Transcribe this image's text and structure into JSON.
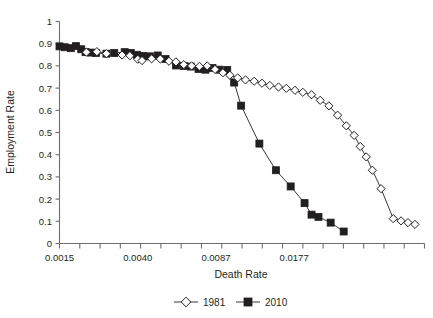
{
  "chart_data": {
    "type": "line",
    "title": "",
    "xlabel": "Death Rate",
    "ylabel": "Employment Rate",
    "ylim": [
      0,
      1
    ],
    "ytick_labels": [
      "1",
      "0.9",
      "0.8",
      "0.7",
      "0.6",
      "0.5",
      "0.4",
      "0.3",
      "0.2",
      "0.1",
      "0"
    ],
    "ytick_values": [
      1,
      0.9,
      0.8,
      0.7,
      0.6,
      0.5,
      0.4,
      0.3,
      0.2,
      0.1,
      0
    ],
    "xtick_labels": [
      "0.0015",
      "0.0040",
      "0.0087",
      "0.0177"
    ],
    "xtick_label_positions": [
      0,
      9,
      18,
      27
    ],
    "x_minor_tick_count": 18,
    "grid": false,
    "legend_position": "bottom",
    "marker_styles": {
      "1981": "open-diamond",
      "2010": "filled-square"
    },
    "series": [
      {
        "name": "1981",
        "marker": "open-diamond",
        "x": [
          3.1,
          4.3,
          5.4,
          7.2,
          8.1,
          9.0,
          9.5,
          10.6,
          11.6,
          12.6,
          13.4,
          14.3,
          15.2,
          16.1,
          17.0,
          17.9,
          18.8,
          19.6,
          20.5,
          21.4,
          22.4,
          23.3,
          24.2,
          25.2,
          26.1,
          27.1,
          28.0,
          29.0,
          30.0,
          31.0,
          32.0,
          33.0,
          33.9,
          34.6,
          35.3,
          36.0
        ],
        "values": [
          0.862,
          0.864,
          0.855,
          0.849,
          0.846,
          0.83,
          0.824,
          0.832,
          0.831,
          0.821,
          0.818,
          0.806,
          0.8,
          0.798,
          0.8,
          0.784,
          0.769,
          0.758,
          0.746,
          0.737,
          0.731,
          0.722,
          0.712,
          0.705,
          0.699,
          0.69,
          0.681,
          0.67,
          0.645,
          0.62,
          0.578,
          0.53,
          0.487,
          0.437,
          0.39,
          0.33
        ]
      },
      {
        "name": "1981_tail",
        "marker": "open-diamond",
        "x": [
          36.0,
          37.0,
          38.4,
          39.3,
          40.1,
          40.9
        ],
        "values": [
          0.33,
          0.247,
          0.112,
          0.102,
          0.094,
          0.086
        ]
      },
      {
        "name": "2010",
        "marker": "filled-square",
        "x": [
          0.0,
          0.6,
          1.3,
          1.9,
          2.5,
          3.0,
          3.6,
          4.2,
          5.4,
          6.3,
          7.5,
          8.2,
          8.9,
          9.6,
          10.4,
          11.3,
          12.2,
          13.4,
          14.3,
          15.1,
          16.0,
          16.8,
          17.6,
          18.4,
          19.3,
          20.1,
          20.9
        ],
        "values": [
          0.888,
          0.884,
          0.88,
          0.889,
          0.875,
          0.862,
          0.86,
          0.858,
          0.855,
          0.858,
          0.862,
          0.858,
          0.85,
          0.845,
          0.843,
          0.847,
          0.831,
          0.802,
          0.8,
          0.797,
          0.786,
          0.783,
          0.791,
          0.783,
          0.782,
          0.725,
          0.621
        ]
      },
      {
        "name": "2010_tail",
        "marker": "filled-square",
        "x": [
          20.9,
          23.0,
          24.9,
          26.6,
          28.2,
          29.0,
          29.8,
          31.2,
          32.7
        ],
        "values": [
          0.621,
          0.45,
          0.33,
          0.257,
          0.182,
          0.13,
          0.12,
          0.094,
          0.054
        ]
      }
    ]
  },
  "legend": {
    "entries": [
      {
        "label": "1981",
        "marker": "open-diamond"
      },
      {
        "label": "2010",
        "marker": "filled-square"
      }
    ]
  },
  "axes": {
    "x_title": "Death Rate",
    "y_title": "Employment Rate"
  }
}
